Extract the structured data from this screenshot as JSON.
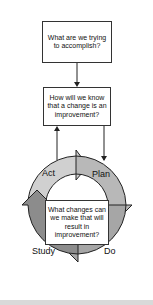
{
  "diagram": {
    "questions": [
      {
        "id": "q1",
        "text": "What are we trying to accomplish?"
      },
      {
        "id": "q2",
        "text": "How will we know that a change is an improvement?"
      },
      {
        "id": "q3",
        "text": "What changes can we make that will result in improvement?"
      }
    ],
    "cycle": {
      "stages": [
        {
          "label": "Act",
          "color": "#d0d0d0"
        },
        {
          "label": "Plan",
          "color": "#b8b8b8"
        },
        {
          "label": "Do",
          "color": "#a6a6a6"
        },
        {
          "label": "Study",
          "color": "#8c8c8c"
        }
      ]
    },
    "colors": {
      "border": "#333333",
      "footer": "#d9d9d9"
    }
  }
}
